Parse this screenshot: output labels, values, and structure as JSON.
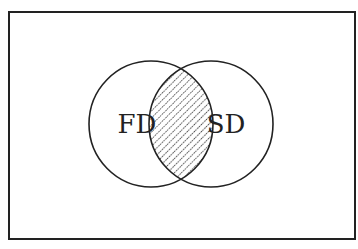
{
  "diagram": {
    "type": "venn",
    "universe": {
      "label": "",
      "x": 9,
      "y": 12,
      "width": 346,
      "height": 227
    },
    "sets": [
      {
        "id": "fd",
        "label": "FD",
        "cx": 151,
        "cy": 124,
        "rx": 62,
        "ry": 63
      },
      {
        "id": "sd",
        "label": "SD",
        "cx": 211,
        "cy": 124,
        "rx": 62,
        "ry": 63
      }
    ],
    "intersection": {
      "label": "",
      "fill": "hatched",
      "hatch_direction": "diagonal-down-right",
      "hatch_spacing": 5
    },
    "colors": {
      "stroke": "#222222",
      "background": "#ffffff",
      "hatch": "#222222"
    }
  }
}
